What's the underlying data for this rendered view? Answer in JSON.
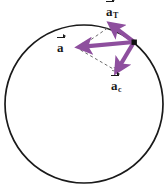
{
  "figure": {
    "background_color": "#ffffff",
    "width": 168,
    "height": 187
  },
  "colors": {
    "circle_stroke": "#1a1a1a",
    "vector_purple": "#8e4f9e",
    "vector_purple_light": "#a36bb0",
    "dashed_line": "#6b6b6b",
    "particle_dot": "#111111",
    "label_text": "#1a1a1a"
  },
  "circle": {
    "name": "circular-path",
    "center_x": 84,
    "center_y": 104,
    "radius": 79,
    "stroke_width": 1.6,
    "fill": "none"
  },
  "particle": {
    "name": "particle-dot",
    "x": 134,
    "y": 42,
    "size": 5
  },
  "vectors": [
    {
      "id": "a-total",
      "symbol": "a",
      "subscript": "",
      "label": "a⃗",
      "description": "total acceleration",
      "from_x": 134,
      "from_y": 42,
      "to_x": 80,
      "to_y": 47,
      "stroke_width": 4.2
    },
    {
      "id": "a-tangential",
      "symbol": "a",
      "subscript": "T",
      "label": "a⃗T",
      "description": "tangential acceleration",
      "from_x": 134,
      "from_y": 42,
      "to_x": 112,
      "to_y": 24,
      "stroke_width": 4.2
    },
    {
      "id": "a-centripetal",
      "symbol": "a",
      "subscript": "c",
      "label": "a⃗c",
      "description": "centripetal acceleration",
      "from_x": 134,
      "from_y": 42,
      "to_x": 117,
      "to_y": 71,
      "stroke_width": 4.2
    }
  ],
  "construction_lines": [
    {
      "id": "dash-tangential-to-total",
      "from_x": 112,
      "from_y": 24,
      "to_x": 80,
      "to_y": 47,
      "dash": "3,3"
    },
    {
      "id": "dash-total-to-centripetal",
      "from_x": 80,
      "from_y": 47,
      "to_x": 117,
      "to_y": 71,
      "dash": "3,3"
    }
  ],
  "labels": {
    "a_total": {
      "base": "a",
      "subscript": ""
    },
    "a_tangential": {
      "base": "a",
      "subscript": "T"
    },
    "a_centripetal": {
      "base": "a",
      "subscript": "c"
    }
  }
}
